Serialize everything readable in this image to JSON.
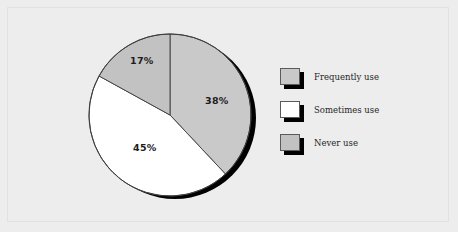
{
  "chart_data": {
    "type": "pie",
    "title": "",
    "categories": [
      "Frequently use",
      "Sometimes use",
      "Never use"
    ],
    "values": [
      38,
      45,
      17
    ],
    "value_labels": [
      "38%",
      "45%",
      "17%"
    ],
    "unit": "%",
    "total": 100,
    "start_angle_deg": 0,
    "direction": "clockwise",
    "legend_position": "right",
    "grid": false,
    "slice_colors": [
      "#c9c9c9",
      "#ffffff",
      "#c2c2c2"
    ],
    "series": [
      {
        "name": "Usage frequency",
        "values": [
          38,
          45,
          17
        ]
      }
    ]
  },
  "canvas": {
    "background_color": "#ededed",
    "frame_color": "#e2e2e2"
  },
  "pie": {
    "shadow_color": "#000000",
    "outline_color": "#3d3d3d",
    "slices": [
      {
        "key": "frequently",
        "label": "Frequently use",
        "value": 38,
        "value_label": "38%",
        "color": "#c9c9c9"
      },
      {
        "key": "sometimes",
        "label": "Sometimes use",
        "value": 45,
        "value_label": "45%",
        "color": "#ffffff"
      },
      {
        "key": "never",
        "label": "Never use",
        "value": 17,
        "value_label": "17%",
        "color": "#c2c2c2"
      }
    ]
  },
  "legend": {
    "items": [
      {
        "label": "Frequently use",
        "color": "#c9c9c9"
      },
      {
        "label": "Sometimes use",
        "color": "#ffffff"
      },
      {
        "label": "Never use",
        "color": "#c2c2c2"
      }
    ]
  }
}
